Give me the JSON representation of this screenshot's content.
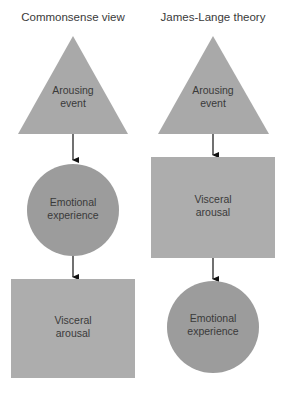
{
  "columns": [
    {
      "title": "Commonsense view",
      "nodes": [
        {
          "shape": "triangle",
          "line1": "Arousing",
          "line2": "event"
        },
        {
          "shape": "circle",
          "line1": "Emotional",
          "line2": "experience"
        },
        {
          "shape": "rectangle",
          "line1": "Visceral",
          "line2": "arousal"
        }
      ]
    },
    {
      "title": "James-Lange theory",
      "nodes": [
        {
          "shape": "triangle",
          "line1": "Arousing",
          "line2": "event"
        },
        {
          "shape": "rectangle",
          "line1": "Visceral",
          "line2": "arousal"
        },
        {
          "shape": "circle",
          "line1": "Emotional",
          "line2": "experience"
        }
      ]
    }
  ],
  "colors": {
    "triangle": "#a9a9a9",
    "circle": "#9c9c9c",
    "rectangle": "#adadad",
    "arrow": "#111111",
    "text": "#3a3a3a"
  }
}
